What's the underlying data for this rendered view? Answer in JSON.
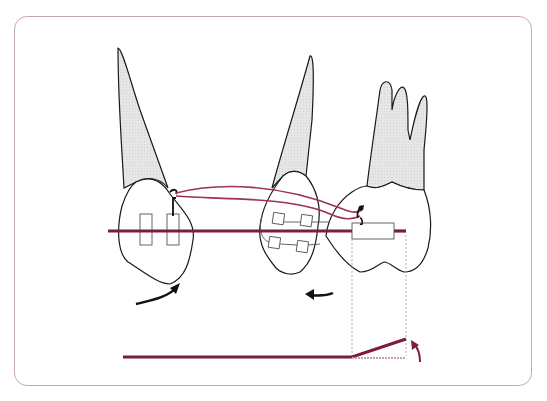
{
  "figure": {
    "colors": {
      "frame": "#c9a6b0",
      "wire": "#7a1f36",
      "elastic": "#9c3350",
      "root_fill": "#e4e4e4",
      "outline": "#1a1a1a",
      "arrow_dark": "#111111",
      "arrow_red": "#7a1f36"
    },
    "teeth": [
      {
        "name": "canine"
      },
      {
        "name": "premolar"
      },
      {
        "name": "molar"
      }
    ],
    "arrows": [
      {
        "name": "canine-rotation-arrow",
        "direction": "clockwise-up-right"
      },
      {
        "name": "premolar-movement-arrow",
        "direction": "left"
      },
      {
        "name": "wire-bend-arrow",
        "direction": "up"
      }
    ]
  }
}
